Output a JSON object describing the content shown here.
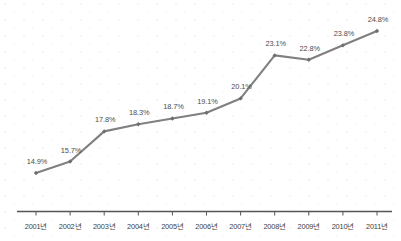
{
  "chart_data": {
    "type": "line",
    "title": "",
    "subtitle": "",
    "xlabel": "",
    "ylabel": "",
    "categories": [
      "2001년",
      "2002년",
      "2003년",
      "2004년",
      "2005년",
      "2006년",
      "2007년",
      "2008년",
      "2009년",
      "2010년",
      "2011년"
    ],
    "values": [
      14.9,
      15.7,
      17.8,
      18.3,
      18.7,
      19.1,
      20.1,
      23.1,
      22.8,
      23.8,
      24.8
    ],
    "point_labels": [
      "14.9%",
      "15.7%",
      "17.8%",
      "18.3%",
      "18.7%",
      "19.1%",
      "20.1%",
      "23.1%",
      "22.8%",
      "23.8%",
      "24.8%"
    ],
    "ylim": [
      13.6,
      25.6
    ],
    "grid": false,
    "legend": null,
    "series": [
      {
        "name": "",
        "values": [
          14.9,
          15.7,
          17.8,
          18.3,
          18.7,
          19.1,
          20.1,
          23.1,
          22.8,
          23.8,
          24.8
        ]
      }
    ],
    "colors": {
      "line": "#808080",
      "marker": "#6e6e6e",
      "axis": "#555555",
      "label_text": "#4c4c4c",
      "tick_text": "#3f3f3f",
      "background": "#ffffff"
    }
  }
}
